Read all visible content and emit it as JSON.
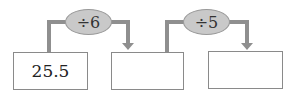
{
  "diagram": {
    "type": "flow-chain",
    "boxes": [
      {
        "value": "25.5"
      },
      {
        "value": ""
      },
      {
        "value": ""
      }
    ],
    "operations": [
      {
        "label": "÷6"
      },
      {
        "label": "÷5"
      }
    ],
    "colors": {
      "connector": "#8f8f8f",
      "operation_fill": "#c9c9c9",
      "box_border": "#8a8a8a"
    }
  }
}
